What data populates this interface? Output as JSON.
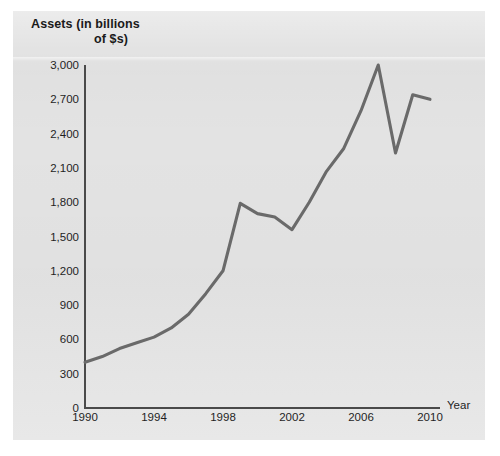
{
  "figure": {
    "background_color": "#ffffff",
    "panel_color": "#e3e3e3",
    "axis_color": "#4a4a4a",
    "series_color": "#6a6a6a"
  },
  "title": {
    "line1": "Assets (in billions",
    "line2": "of $s)"
  },
  "chart_data": {
    "type": "line",
    "title": "Assets (in billions of $s)",
    "xlabel": "Year",
    "ylabel": "Assets (in billions of $s)",
    "xlim": [
      1990,
      2010
    ],
    "ylim": [
      0,
      3000
    ],
    "grid": false,
    "legend": null,
    "x_ticks": [
      "1990",
      "1994",
      "1998",
      "2002",
      "2006",
      "2010"
    ],
    "x_tick_values": [
      1990,
      1994,
      1998,
      2002,
      2006,
      2010
    ],
    "y_ticks": [
      "0",
      "300",
      "600",
      "900",
      "1,200",
      "1,500",
      "1,800",
      "2,100",
      "2,400",
      "2,700",
      "3,000"
    ],
    "y_tick_values": [
      0,
      300,
      600,
      900,
      1200,
      1500,
      1800,
      2100,
      2400,
      2700,
      3000
    ],
    "x": [
      1990,
      1991,
      1992,
      1993,
      1994,
      1995,
      1996,
      1997,
      1998,
      1999,
      2000,
      2001,
      2002,
      2003,
      2004,
      2005,
      2006,
      2007,
      2008,
      2009,
      2010
    ],
    "values": [
      400,
      450,
      520,
      570,
      620,
      700,
      820,
      1000,
      1200,
      1790,
      1700,
      1670,
      1560,
      1800,
      2070,
      2270,
      2600,
      3000,
      2230,
      2740,
      2700
    ],
    "series": [
      {
        "name": "Assets",
        "values": [
          400,
          450,
          520,
          570,
          620,
          700,
          820,
          1000,
          1200,
          1790,
          1700,
          1670,
          1560,
          1800,
          2070,
          2270,
          2600,
          3000,
          2230,
          2740,
          2700
        ]
      }
    ]
  }
}
